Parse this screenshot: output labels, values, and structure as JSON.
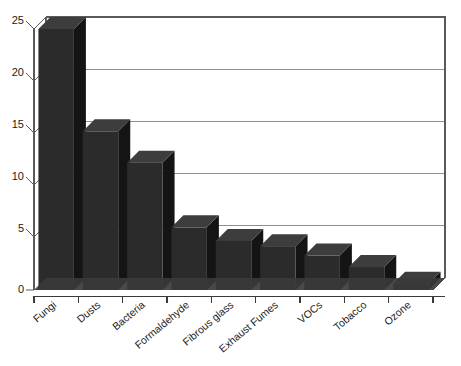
{
  "chart_data": {
    "type": "bar",
    "title": "",
    "subtitle": "",
    "xlabel": "",
    "ylabel": "",
    "categories": [
      "Fungi",
      "Dusts",
      "Bacteria",
      "Formaldehyde",
      "Fibrous glass",
      "Exhaust Fumes",
      "VOCs",
      "Tobacco",
      "Ozone"
    ],
    "values": [
      25.0,
      15.2,
      12.2,
      6.0,
      4.7,
      4.2,
      3.3,
      2.2,
      0.6
    ],
    "ylim": [
      0,
      25
    ],
    "yticks": [
      0,
      5,
      10,
      15,
      20,
      25
    ],
    "ytick_labels": [
      "0",
      "5",
      "10",
      "15",
      "20",
      "25"
    ],
    "grid": true,
    "grid_axis": "y",
    "legend": false,
    "legend_position": "none",
    "style": "3d-bars-grayscale",
    "bar_color": "#2b2b2b",
    "bar_side_color": "#141414",
    "bar_top_color": "#3d3d3d",
    "grid_color": "#8e8e8e",
    "axis_color": "#3a3a3a",
    "background_color": "#ffffff",
    "xtick_label_rotation": -40
  }
}
